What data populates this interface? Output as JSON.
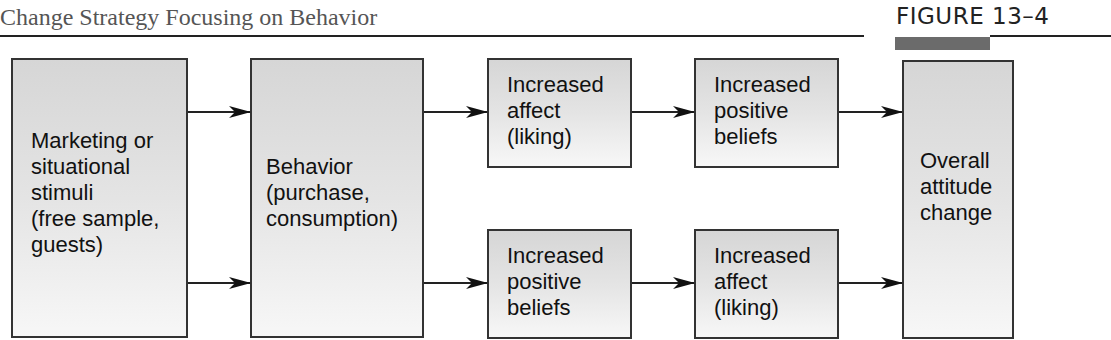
{
  "header": {
    "title": "Change Strategy Focusing on Behavior",
    "figure_label": "FIGURE  13–4"
  },
  "diagram": {
    "nodes": [
      {
        "id": "stimuli",
        "label": "Marketing or\nsituational\nstimuli\n(free sample,\nguests)"
      },
      {
        "id": "behavior",
        "label": "Behavior\n(purchase,\nconsumption)"
      },
      {
        "id": "top-affect",
        "label": "Increased\naffect\n(liking)"
      },
      {
        "id": "top-beliefs",
        "label": "Increased\npositive\nbeliefs"
      },
      {
        "id": "bottom-beliefs",
        "label": "Increased\npositive\nbeliefs"
      },
      {
        "id": "bottom-affect",
        "label": "Increased\naffect\n(liking)"
      },
      {
        "id": "attitude",
        "label": "Overall\nattitude\nchange"
      }
    ],
    "edges": [
      {
        "from": "stimuli",
        "to": "behavior",
        "lane": "top"
      },
      {
        "from": "stimuli",
        "to": "behavior",
        "lane": "bottom"
      },
      {
        "from": "behavior",
        "to": "top-affect"
      },
      {
        "from": "top-affect",
        "to": "top-beliefs"
      },
      {
        "from": "top-beliefs",
        "to": "attitude"
      },
      {
        "from": "behavior",
        "to": "bottom-beliefs"
      },
      {
        "from": "bottom-beliefs",
        "to": "bottom-affect"
      },
      {
        "from": "bottom-affect",
        "to": "attitude"
      }
    ]
  }
}
